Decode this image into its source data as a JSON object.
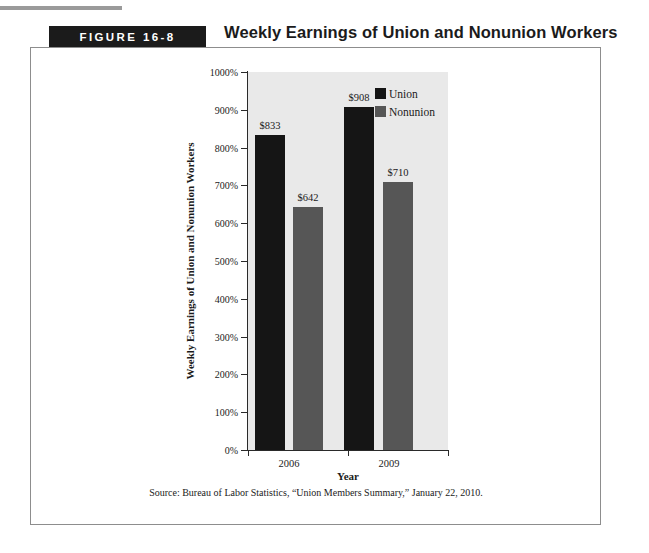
{
  "figure": {
    "badge_label": "FIGURE 16-8",
    "title": "Weekly Earnings of Union and Nonunion Workers",
    "source_note": "Source: Bureau of Labor Statistics, “Union Members Summary,” January 22, 2010."
  },
  "chart_data": {
    "type": "bar",
    "title": "Weekly Earnings of Union and Nonunion Workers",
    "xlabel": "Year",
    "ylabel": "Weekly Earnings of Union and Nonunion Workers",
    "categories": [
      "2006",
      "2009"
    ],
    "series": [
      {
        "name": "Union",
        "color": "#151515",
        "values": [
          833,
          710
        ],
        "value_labels": [
          "$833",
          "$908"
        ],
        "plotted_percent": [
          833,
          908
        ]
      },
      {
        "name": "Nonunion",
        "color": "#565656",
        "values": [
          642,
          710
        ],
        "value_labels": [
          "$642",
          "$710"
        ],
        "plotted_percent": [
          642,
          710
        ]
      }
    ],
    "bars": [
      {
        "category": "2006",
        "series": "Union",
        "label": "$833",
        "percent": 833
      },
      {
        "category": "2006",
        "series": "Nonunion",
        "label": "$642",
        "percent": 642
      },
      {
        "category": "2009",
        "series": "Union",
        "label": "$908",
        "percent": 908
      },
      {
        "category": "2009",
        "series": "Nonunion",
        "label": "$710",
        "percent": 710
      }
    ],
    "ylim": [
      0,
      1000
    ],
    "ytick_labels": [
      "0%",
      "100%",
      "200%",
      "300%",
      "400%",
      "500%",
      "600%",
      "700%",
      "800%",
      "900%",
      "1000%"
    ],
    "ytick_values": [
      0,
      100,
      200,
      300,
      400,
      500,
      600,
      700,
      800,
      900,
      1000
    ],
    "grid": false,
    "legend_position": "top-right",
    "legend": [
      {
        "label": "Union",
        "color": "#151515"
      },
      {
        "label": "Nonunion",
        "color": "#565656"
      }
    ],
    "plot_background": "#e9e9e9"
  }
}
